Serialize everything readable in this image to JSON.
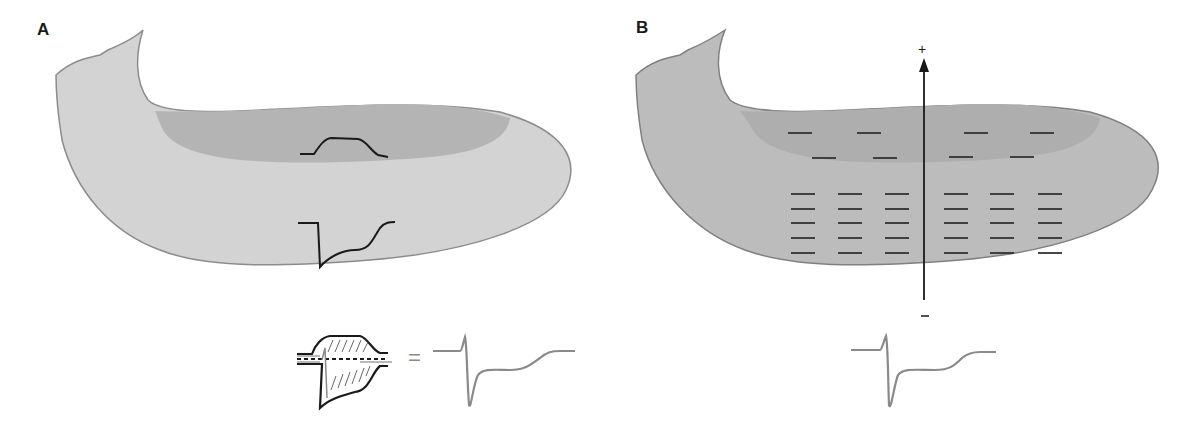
{
  "panels": [
    {
      "label": "A",
      "description": "Ventricle wall with inner (endocardial) and outer regions, showing two local waveforms",
      "colors": {
        "outer": "#d3d3d3",
        "inner": "#b4b4b4",
        "outline": "#8c8c8c",
        "trace": "#1a1a1a",
        "result_trace": "#8a8a8a"
      },
      "equation_symbol": "="
    },
    {
      "label": "B",
      "description": "Ventricle with negative charge markers and a dipole vector arrow",
      "colors": {
        "outer": "#bcbcbc",
        "inner": "#aeaeae",
        "outline": "#808080",
        "charge": "#333333",
        "result_trace": "#8a8a8a"
      },
      "arrow": {
        "top_sign": "+",
        "bottom_sign": "–"
      },
      "charge_sign": "–",
      "upper_charges": 8,
      "lower_charge_grid": {
        "columns": 6,
        "rows": 5
      }
    }
  ]
}
